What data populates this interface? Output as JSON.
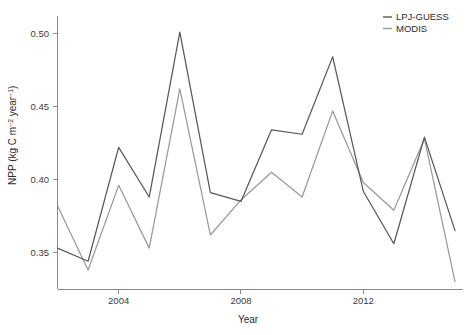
{
  "chart_data": {
    "type": "line",
    "title": "",
    "xlabel": "Year",
    "ylabel": "NPP (kg C m-2 year-1)",
    "ylabel_parts": {
      "main": "NPP  (kg C m",
      "sup1": "−2",
      "mid": " year",
      "sup2": "−1",
      "close": ")"
    },
    "x": [
      2002,
      2003,
      2004,
      2005,
      2006,
      2007,
      2008,
      2009,
      2010,
      2011,
      2012,
      2013,
      2014,
      2015
    ],
    "xticks": [
      2004,
      2008,
      2012
    ],
    "xtick_labels": [
      "2004",
      "2008",
      "2012"
    ],
    "yticks": [
      0.35,
      0.4,
      0.45,
      0.5
    ],
    "ytick_labels": [
      "0.35",
      "0.40",
      "0.45",
      "0.50"
    ],
    "xlim": [
      2002,
      2015
    ],
    "ylim": [
      0.325,
      0.512
    ],
    "grid": false,
    "legend_position": "top-right",
    "series": [
      {
        "name": "LPJ-GUESS",
        "color": "#595959",
        "values": [
          0.353,
          0.344,
          0.422,
          0.388,
          0.501,
          0.391,
          0.385,
          0.434,
          0.431,
          0.484,
          0.392,
          0.356,
          0.429,
          0.365
        ]
      },
      {
        "name": "MODIS",
        "color": "#9a9a9a",
        "values": [
          0.382,
          0.338,
          0.396,
          0.353,
          0.462,
          0.362,
          0.386,
          0.405,
          0.388,
          0.447,
          0.398,
          0.379,
          0.428,
          0.33
        ]
      }
    ]
  },
  "legend": {
    "entries": [
      {
        "label": "LPJ-GUESS",
        "color": "#595959"
      },
      {
        "label": "MODIS",
        "color": "#9a9a9a"
      }
    ]
  },
  "axes": {
    "x_title": "Year",
    "y_title": "NPP (kg C m-2 year-1)"
  }
}
